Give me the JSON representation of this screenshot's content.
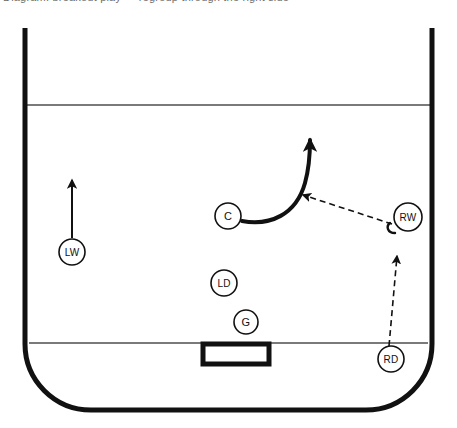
{
  "caption": {
    "text": "Diagram: breakout play — regroup through the right side"
  },
  "rink": {
    "surface_color": "#ffffff",
    "boards_color": "#111111",
    "line_color": "#7a7a7a",
    "boards_width": 5,
    "blue_line_label": "blue line",
    "goal_line_label": "goal line",
    "net_label": "net",
    "left_boards_x": 25,
    "right_boards_x": 432,
    "bottom_boards_y": 410,
    "top_cut_y": 28,
    "corner_radius": 66,
    "blue_line_y": 105,
    "goal_line_y": 343
  },
  "net": {
    "x": 203,
    "y": 344,
    "width": 66,
    "height": 20
  },
  "players": [
    {
      "id": "lw",
      "label": "LW",
      "name": "left-wing",
      "cx": 72,
      "cy": 252,
      "r": 13
    },
    {
      "id": "c",
      "label": "C",
      "name": "center",
      "cx": 228,
      "cy": 216,
      "r": 13
    },
    {
      "id": "ld",
      "label": "LD",
      "name": "left-defense",
      "cx": 224,
      "cy": 283,
      "r": 13
    },
    {
      "id": "g",
      "label": "G",
      "name": "goalie",
      "cx": 246,
      "cy": 322,
      "r": 12
    },
    {
      "id": "rw",
      "label": "RW",
      "name": "right-wing",
      "cx": 408,
      "cy": 217,
      "r": 14
    },
    {
      "id": "rd",
      "label": "RD",
      "name": "right-defense",
      "cx": 391,
      "cy": 359,
      "r": 13
    }
  ],
  "movements": [
    {
      "id": "lw-skate",
      "type": "skate",
      "style": "straight",
      "from": "LW",
      "to": "up-ice",
      "path": "M 72 238 L 72 180",
      "arrow_tip": [
        72,
        170
      ],
      "color": "#111111",
      "width": 2
    },
    {
      "id": "c-skate",
      "type": "skate",
      "style": "curved",
      "from": "C",
      "to": "high-slot",
      "path": "M 242 221 C 270 226, 296 215, 305 183 C 310 165, 310 148, 310 140",
      "arrow_tip": [
        310,
        128
      ],
      "color": "#111111",
      "width": 4
    }
  ],
  "passes": [
    {
      "id": "rw-to-c",
      "type": "pass",
      "style": "dashed",
      "from": "RW",
      "to": "C",
      "path": "M 392 224 L 303 195",
      "arrow_tip": [
        292,
        192
      ],
      "color": "#111111",
      "width": 1.6,
      "dash": "6,4"
    },
    {
      "id": "rd-to-rw",
      "type": "pass",
      "style": "dashed",
      "from": "RD",
      "to": "RW",
      "path": "M 389 346 L 397 256",
      "arrow_tip": [
        398,
        243
      ],
      "color": "#111111",
      "width": 1.6,
      "dash": "6,4"
    }
  ],
  "stick": {
    "id": "rw-stick",
    "path": "M 395 233 C 387 233, 386 226, 390 223",
    "color": "#111111",
    "width": 2.4
  }
}
